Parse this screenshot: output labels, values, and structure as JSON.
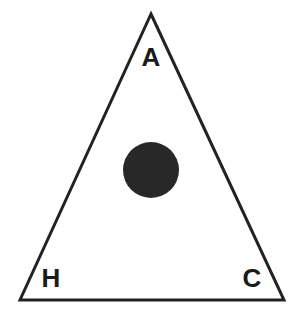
{
  "figure": {
    "background_color": "#ffffff",
    "width": 292,
    "height": 321,
    "triangle": {
      "name": "outline-triangle",
      "stroke_color": "#222222",
      "stroke_width": 3,
      "fill": "none",
      "points": "151,14 284,300 20,300",
      "vertices": {
        "apex": {
          "x": 151,
          "y": 14
        },
        "bottom_left": {
          "x": 20,
          "y": 300
        },
        "bottom_right": {
          "x": 284,
          "y": 300
        }
      }
    },
    "circle": {
      "name": "filled-circle",
      "fill_color": "#282828",
      "cx": 151,
      "cy": 170,
      "r": 28
    },
    "labels": {
      "apex": "A",
      "bottom_left": "H",
      "bottom_right": "C"
    },
    "label_color": "#1a1a1a"
  }
}
